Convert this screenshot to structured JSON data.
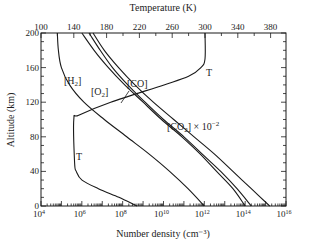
{
  "chart_data": {
    "type": "line",
    "title": "",
    "xlabel": "Number density (cm⁻³)",
    "ylabel": "Altitude (km)",
    "x2label": "Temperature (K)",
    "xscale": "log",
    "xlim_log10": [
      4,
      16
    ],
    "ylim": [
      0,
      200
    ],
    "x2lim": [
      100,
      400
    ],
    "grid": false,
    "x_ticks": [
      {
        "exp": 4,
        "label": "10",
        "sup": "4"
      },
      {
        "exp": 6,
        "label": "10",
        "sup": "6"
      },
      {
        "exp": 8,
        "label": "10",
        "sup": "8"
      },
      {
        "exp": 10,
        "label": "10",
        "sup": "10"
      },
      {
        "exp": 12,
        "label": "10",
        "sup": "12"
      },
      {
        "exp": 14,
        "label": "10",
        "sup": "14"
      },
      {
        "exp": 16,
        "label": "10",
        "sup": "16"
      }
    ],
    "y_ticks": [
      0,
      40,
      80,
      120,
      160,
      200
    ],
    "x2_ticks": [
      100,
      140,
      180,
      220,
      260,
      300,
      340,
      380
    ],
    "series": [
      {
        "name": "[H2]",
        "axis": "density",
        "label_base": "[H",
        "label_sub": "2",
        "label_end": "]",
        "alt": [
          200,
          180,
          160,
          140,
          120,
          100,
          80,
          60,
          40,
          20,
          0
        ],
        "log10_density": [
          4.8,
          4.85,
          5.0,
          5.4,
          6.1,
          7.1,
          8.2,
          9.3,
          10.3,
          11.2,
          12.0
        ]
      },
      {
        "name": "[O2]",
        "axis": "density",
        "label_base": "[O",
        "label_sub": "2",
        "label_end": "]",
        "alt": [
          200,
          180,
          160,
          140,
          120,
          100,
          80,
          60,
          40,
          20,
          0
        ],
        "log10_density": [
          6.0,
          6.6,
          7.3,
          8.1,
          9.0,
          9.9,
          10.9,
          11.8,
          12.6,
          13.4,
          14.0
        ]
      },
      {
        "name": "[CO]",
        "axis": "density",
        "label_base": "[CO]",
        "label_sub": "",
        "label_end": "",
        "alt": [
          200,
          180,
          160,
          140,
          120,
          100,
          80,
          60,
          40,
          20,
          0
        ],
        "log10_density": [
          6.35,
          6.9,
          7.5,
          8.25,
          9.1,
          10.0,
          11.0,
          11.9,
          12.8,
          13.6,
          14.3
        ]
      },
      {
        "name": "[CO2] x 10^-2",
        "axis": "density",
        "label_base": "[CO",
        "label_sub": "2",
        "label_end": "] × 10",
        "label_sup": "−2",
        "alt": [
          200,
          180,
          160,
          140,
          120,
          100,
          80,
          60,
          40,
          20,
          0
        ],
        "log10_density": [
          6.55,
          7.1,
          7.8,
          8.6,
          9.5,
          10.5,
          11.5,
          12.5,
          13.4,
          14.3,
          15.2
        ]
      },
      {
        "name": "T",
        "axis": "temperature",
        "label_base": "T",
        "alt": [
          0,
          10,
          20,
          30,
          40,
          50,
          100,
          105,
          120,
          140,
          150,
          160,
          170,
          200
        ],
        "temperature_K": [
          217,
          195,
          170,
          150,
          143,
          141,
          140,
          146,
          185,
          250,
          280,
          295,
          300,
          300
        ]
      }
    ],
    "annotations": [
      {
        "text": "T",
        "near": "temperature curve, upper right (~150 km, 300 K)"
      },
      {
        "text": "T",
        "near": "temperature curve, lower left (~70 km, 140 K)"
      }
    ]
  }
}
